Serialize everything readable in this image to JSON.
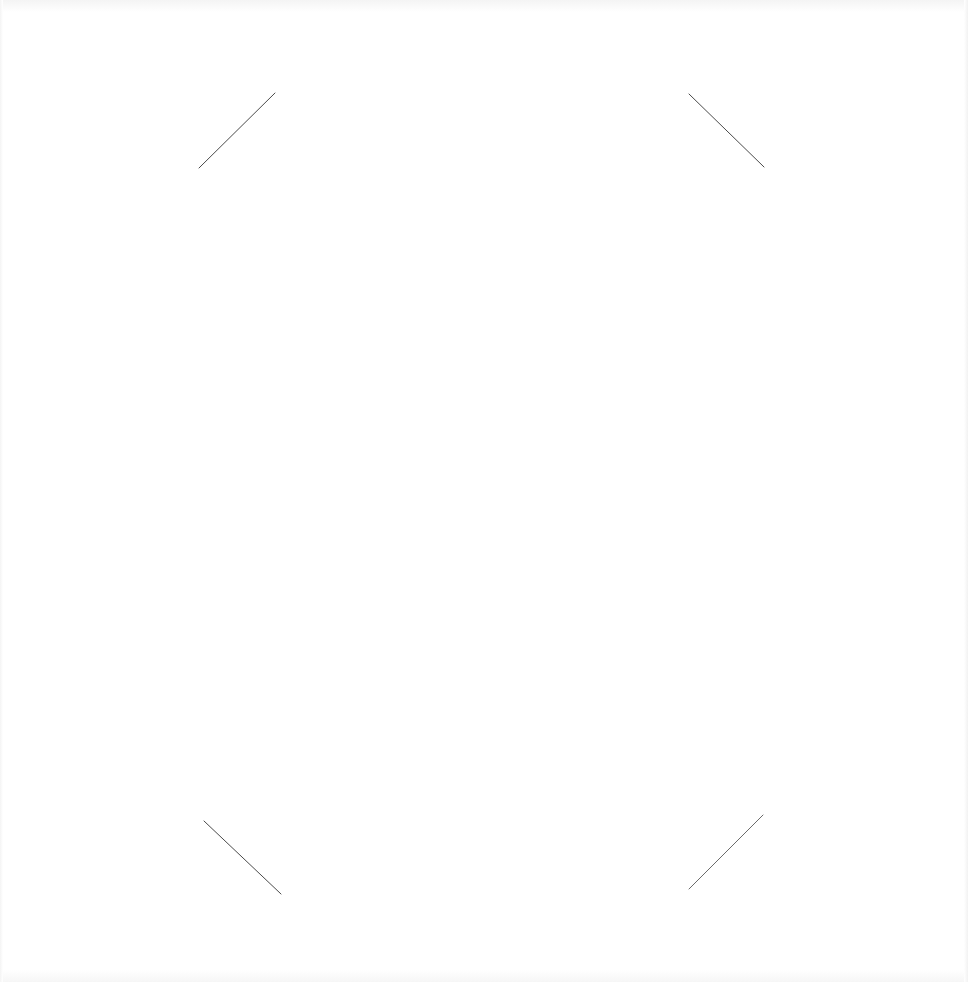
{
  "page": {
    "background": "#ffffff",
    "mark_color": "#4a4a4a"
  },
  "corner_marks": [
    {
      "name": "top-left",
      "x1": 199,
      "y1": 168,
      "x2": 275,
      "y2": 93
    },
    {
      "name": "top-right",
      "x1": 689,
      "y1": 94,
      "x2": 764,
      "y2": 167
    },
    {
      "name": "bottom-left",
      "x1": 204,
      "y1": 821,
      "x2": 281,
      "y2": 894
    },
    {
      "name": "bottom-right",
      "x1": 689,
      "y1": 889,
      "x2": 763,
      "y2": 815
    }
  ]
}
